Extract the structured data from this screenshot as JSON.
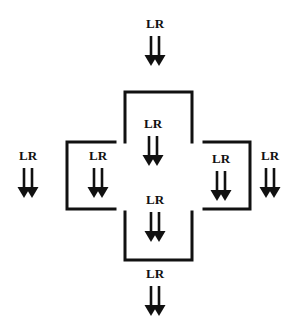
{
  "diagram": {
    "line_color": "#111111",
    "background": "#ffffff",
    "label_text": "LR",
    "arrow_groups": [
      {
        "id": "top-outside",
        "label": "LR",
        "x": 155,
        "label_y": 28,
        "arrow_top": 36,
        "arrow_bottom": 66
      },
      {
        "id": "top-inside",
        "label": "LR",
        "x": 153,
        "label_y": 128,
        "arrow_top": 136,
        "arrow_bottom": 166
      },
      {
        "id": "left-outside",
        "label": "LR",
        "x": 28,
        "label_y": 160,
        "arrow_top": 168,
        "arrow_bottom": 198
      },
      {
        "id": "left-inside",
        "label": "LR",
        "x": 98,
        "label_y": 160,
        "arrow_top": 168,
        "arrow_bottom": 198
      },
      {
        "id": "right-inside",
        "label": "LR",
        "x": 221,
        "label_y": 163,
        "arrow_top": 171,
        "arrow_bottom": 201
      },
      {
        "id": "right-outside",
        "label": "LR",
        "x": 270,
        "label_y": 160,
        "arrow_top": 168,
        "arrow_bottom": 198
      },
      {
        "id": "center",
        "label": "LR",
        "x": 155,
        "label_y": 204,
        "arrow_top": 212,
        "arrow_bottom": 242
      },
      {
        "id": "bottom-outside",
        "label": "LR",
        "x": 155,
        "label_y": 278,
        "arrow_top": 286,
        "arrow_bottom": 316
      }
    ],
    "brackets": [
      {
        "id": "top-bracket",
        "orientation": "open-bottom",
        "x1": 125,
        "x2": 192,
        "y1": 92,
        "y2": 142
      },
      {
        "id": "left-bracket",
        "orientation": "open-right",
        "x1": 67,
        "x2": 115,
        "y1": 142,
        "y2": 209
      },
      {
        "id": "right-bracket",
        "orientation": "open-left",
        "x1": 204,
        "x2": 250,
        "y1": 142,
        "y2": 209
      },
      {
        "id": "bottom-bracket",
        "orientation": "open-top",
        "x1": 125,
        "x2": 192,
        "y1": 212,
        "y2": 260
      }
    ]
  }
}
